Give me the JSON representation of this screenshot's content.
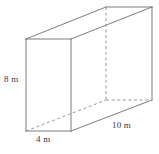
{
  "figure": {
    "name": "rectangular-prism",
    "shape_type": "rectangular prism",
    "unit": "m",
    "stroke_color": "#7d7d7d",
    "hidden_stroke_color": "#9a9a9a",
    "background_color": "#ffffff",
    "text_color": "#3a3a3a"
  },
  "labels": {
    "height": "8 m",
    "width": "4 m",
    "depth": "10 m"
  },
  "dimensions": {
    "height_value": 8,
    "width_value": 4,
    "depth_value": 10,
    "unit": "m"
  },
  "vertices": {
    "front_top_left": [
      26,
      39
    ],
    "front_top_right": [
      71,
      39
    ],
    "front_bottom_right": [
      71,
      131
    ],
    "front_bottom_left": [
      26,
      131
    ],
    "back_top_left": [
      106,
      7
    ],
    "back_top_right": [
      152,
      7
    ],
    "back_bottom_right": [
      152,
      100
    ],
    "back_bottom_left_hidden": [
      106,
      100
    ]
  },
  "edges": {
    "solid": [
      "front_top_left-front_top_right",
      "front_top_right-front_bottom_right",
      "front_bottom_right-front_bottom_left",
      "front_bottom_left-front_top_left",
      "front_top_left-back_top_left",
      "front_top_right-back_top_right",
      "back_top_left-back_top_right",
      "back_top_right-back_bottom_right",
      "front_bottom_right-back_bottom_right"
    ],
    "dashed": [
      "back_top_left-back_bottom_left_hidden",
      "front_bottom_left-back_bottom_left_hidden",
      "back_bottom_left_hidden-back_bottom_right"
    ]
  }
}
